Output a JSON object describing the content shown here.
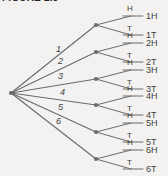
{
  "figure": {
    "caption": "FIGURE 2.5",
    "background_color": "#f3f2f0",
    "line_color": "#6b6b6b",
    "text_color": "#3f3f3f",
    "caption_color": "#231f20"
  },
  "tree": {
    "root": {
      "name": "start-node",
      "x": 11,
      "y": 93
    },
    "stage1": {
      "label": "die-roll",
      "branches": [
        {
          "label": "1",
          "node_x": 96,
          "node_y": 25,
          "label_x": 56,
          "label_y": 52
        },
        {
          "label": "2",
          "node_x": 96,
          "node_y": 52,
          "label_x": 58,
          "label_y": 64
        },
        {
          "label": "3",
          "node_x": 96,
          "node_y": 79,
          "label_x": 58,
          "label_y": 79
        },
        {
          "label": "4",
          "node_x": 96,
          "node_y": 105,
          "label_x": 60,
          "label_y": 95
        },
        {
          "label": "5",
          "node_x": 96,
          "node_y": 132,
          "label_x": 58,
          "label_y": 110
        },
        {
          "label": "6",
          "node_x": 96,
          "node_y": 159,
          "label_x": 56,
          "label_y": 124
        }
      ]
    },
    "stage2": {
      "label": "coin-flip",
      "branch_labels": [
        "H",
        "T"
      ]
    },
    "outcomes": [
      {
        "label": "1H",
        "x": 146,
        "y": 16
      },
      {
        "label": "1T",
        "x": 146,
        "y": 35
      },
      {
        "label": "2H",
        "x": 146,
        "y": 43
      },
      {
        "label": "2T",
        "x": 146,
        "y": 62
      },
      {
        "label": "3H",
        "x": 146,
        "y": 70
      },
      {
        "label": "3T",
        "x": 146,
        "y": 89
      },
      {
        "label": "4H",
        "x": 146,
        "y": 96
      },
      {
        "label": "4T",
        "x": 146,
        "y": 115
      },
      {
        "label": "5H",
        "x": 146,
        "y": 123
      },
      {
        "label": "5T",
        "x": 146,
        "y": 142
      },
      {
        "label": "6H",
        "x": 146,
        "y": 150
      },
      {
        "label": "6T",
        "x": 146,
        "y": 169
      }
    ],
    "stage2_branch_labels": [
      {
        "label": "H",
        "x": 127,
        "y": 11
      },
      {
        "label": "T",
        "x": 127,
        "y": 31
      },
      {
        "label": "H",
        "x": 127,
        "y": 38
      },
      {
        "label": "T",
        "x": 127,
        "y": 58
      },
      {
        "label": "H",
        "x": 127,
        "y": 65
      },
      {
        "label": "T",
        "x": 127,
        "y": 85
      },
      {
        "label": "H",
        "x": 127,
        "y": 91
      },
      {
        "label": "T",
        "x": 127,
        "y": 111
      },
      {
        "label": "H",
        "x": 127,
        "y": 118
      },
      {
        "label": "T",
        "x": 127,
        "y": 138
      },
      {
        "label": "H",
        "x": 127,
        "y": 145
      },
      {
        "label": "T",
        "x": 127,
        "y": 165
      }
    ]
  }
}
